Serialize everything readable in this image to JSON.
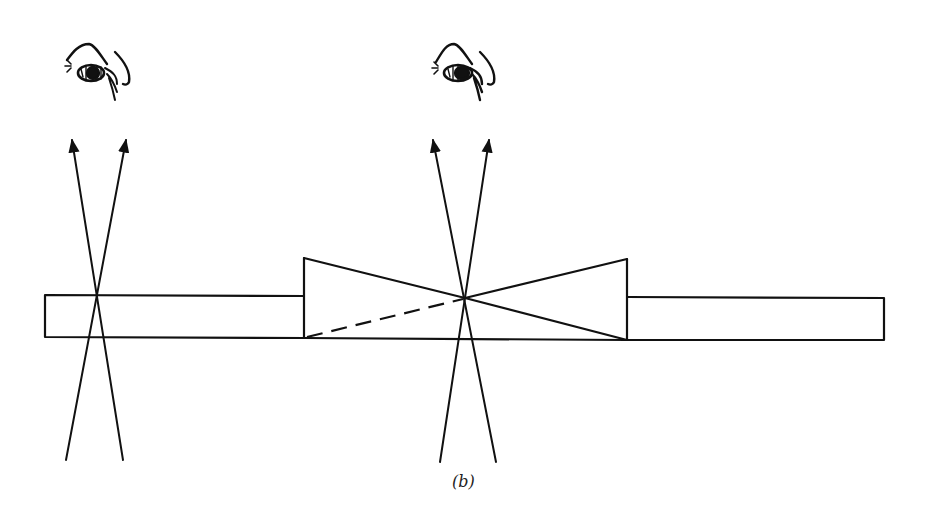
{
  "figure": {
    "caption": "(b)",
    "colors": {
      "ink": "#111111",
      "background": "#ffffff"
    }
  },
  "elements": {
    "left_slab": {
      "x1": 45,
      "x2": 304,
      "top": 295,
      "bottom": 337
    },
    "right_slab": {
      "x1": 627,
      "x2": 884,
      "top": 297,
      "bottom": 340
    },
    "wedge": {
      "left_edge": {
        "x": 304,
        "top": 258,
        "bottom": 338
      },
      "right_edge": {
        "x": 627,
        "top": 259,
        "bottom": 340
      },
      "crossing_point": {
        "x": 465,
        "y": 298
      },
      "dashed_edge": "from bottom-left corner to crossing point"
    },
    "left_observer": {
      "eye_icon": "eye-icon",
      "crossing": {
        "x": 96,
        "y": 295
      }
    },
    "center_observer": {
      "eye_icon": "eye-icon",
      "crossing": {
        "x": 465,
        "y": 298
      }
    }
  }
}
